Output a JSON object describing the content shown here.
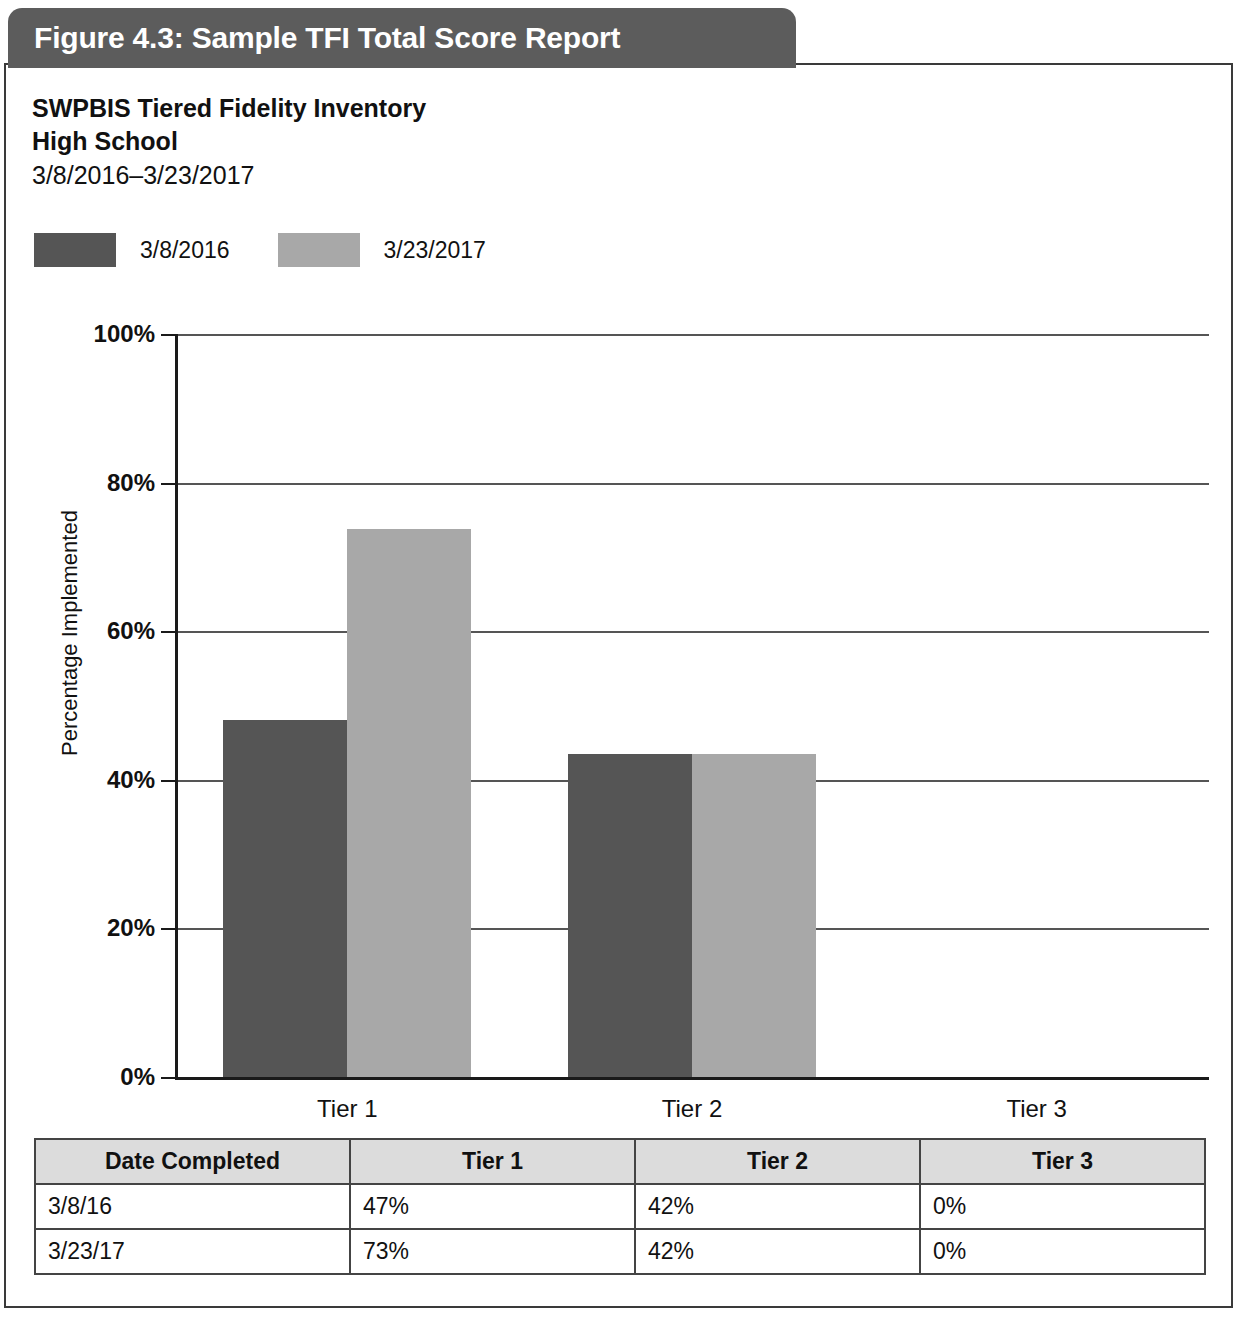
{
  "figure": {
    "banner_label": "Figure 4.3: Sample TFI Total Score Report",
    "banner_color": "#5c5c5c"
  },
  "report": {
    "title": "SWPBIS Tiered Fidelity Inventory",
    "school": "High School",
    "date_range": "3/8/2016–3/23/2017"
  },
  "chart_data": {
    "type": "bar",
    "title": "",
    "xlabel": "",
    "ylabel": "Percentage Implemented",
    "categories": [
      "Tier 1",
      "Tier 2",
      "Tier 3"
    ],
    "series": [
      {
        "name": "3/8/2016",
        "color": "#555555",
        "values": [
          48,
          43.5,
          0
        ]
      },
      {
        "name": "3/23/2017",
        "color": "#a8a8a8",
        "values": [
          73.8,
          43.5,
          0
        ]
      }
    ],
    "ylim": [
      0,
      100
    ],
    "yticks": [
      0,
      20,
      40,
      60,
      80,
      100
    ],
    "ytick_labels": [
      "0%",
      "20%",
      "40%",
      "60%",
      "80%",
      "100%"
    ],
    "grid": true,
    "legend_position": "top-left"
  },
  "table": {
    "headers": [
      "Date Completed",
      "Tier 1",
      "Tier 2",
      "Tier 3"
    ],
    "rows": [
      {
        "date": "3/8/16",
        "tier1": "47%",
        "tier2": "42%",
        "tier3": "0%"
      },
      {
        "date": "3/23/17",
        "tier1": "73%",
        "tier2": "42%",
        "tier3": "0%"
      }
    ]
  }
}
